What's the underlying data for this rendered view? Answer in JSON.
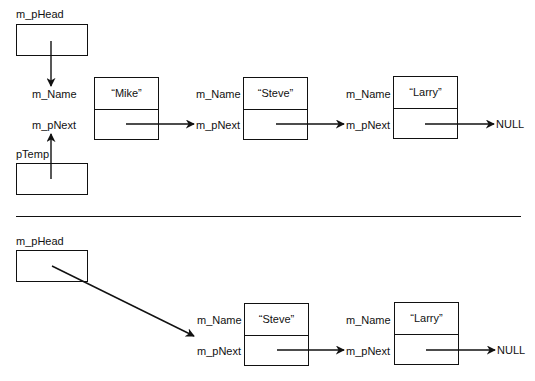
{
  "diagram": {
    "type": "linked-list-deletion",
    "before": {
      "head_label": "m_pHead",
      "temp_label": "pTemp",
      "nodes": [
        {
          "name_field": "m_Name",
          "next_field": "m_pNext",
          "value": "“Mike”"
        },
        {
          "name_field": "m_Name",
          "next_field": "m_pNext",
          "value": "“Steve”"
        },
        {
          "name_field": "m_Name",
          "next_field": "m_pNext",
          "value": "“Larry”"
        }
      ],
      "terminator": "NULL"
    },
    "after": {
      "head_label": "m_pHead",
      "nodes": [
        {
          "name_field": "m_Name",
          "next_field": "m_pNext",
          "value": "“Steve”"
        },
        {
          "name_field": "m_Name",
          "next_field": "m_pNext",
          "value": "“Larry”"
        }
      ],
      "terminator": "NULL"
    },
    "colors": {
      "stroke": "#111111",
      "background": "#ffffff"
    }
  }
}
